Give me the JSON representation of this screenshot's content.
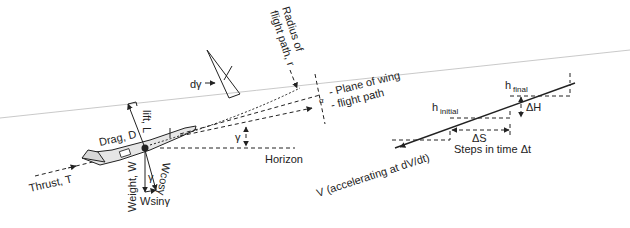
{
  "diagram": {
    "type": "aircraft-flight-forces",
    "left_panel": {
      "labels": {
        "lift": "lift, L",
        "drag": "Drag, D",
        "thrust": "Thrust, T",
        "weight": "Weight, W",
        "wcos": "Wcosγ",
        "wsin": "Wsinγ",
        "gamma": "γ",
        "gamma_small": "γ",
        "horizon": "Horizon",
        "d_gamma": "dγ",
        "radius_line1": "Radius of",
        "radius_line2": "flight path, r",
        "plane_of_wing": "- Plane of wing",
        "alpha": "α",
        "flight_path": "- flight path"
      }
    },
    "right_panel": {
      "labels": {
        "h_initial_base": "h",
        "h_initial_sub": "initial",
        "h_final_base": "h",
        "h_final_sub": "final",
        "delta_h": "ΔH",
        "delta_s": "ΔS",
        "steps": "Steps in time Δt",
        "velocity": "V (accelerating at dV/dt)"
      }
    },
    "colors": {
      "ink": "#222222",
      "guide_line": "#bbbbbb",
      "aircraft_fill": "#e6e6e6"
    }
  }
}
